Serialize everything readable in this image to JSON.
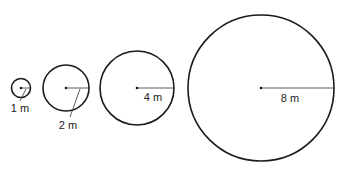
{
  "diagram": {
    "title": "",
    "stroke_color": "#1a1a1a",
    "circles": [
      {
        "radius_label": "1 m",
        "cx": 21,
        "cy": 88,
        "r": 9.5,
        "line": "leader"
      },
      {
        "radius_label": "2 m",
        "cx": 66,
        "cy": 88,
        "r": 23,
        "line": "leader"
      },
      {
        "radius_label": "4 m",
        "cx": 137,
        "cy": 88,
        "r": 37,
        "line": "inside"
      },
      {
        "radius_label": "8 m",
        "cx": 261,
        "cy": 88,
        "r": 73,
        "line": "inside"
      }
    ]
  }
}
